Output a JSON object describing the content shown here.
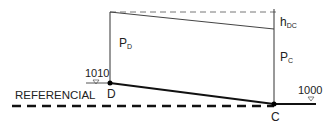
{
  "diagram": {
    "labels": {
      "referencial": "REFERENCIAL",
      "point_d": "D",
      "point_c": "C",
      "elev_d": "1010",
      "elev_c": "1000",
      "pressure_d_main": "P",
      "pressure_d_sub": "D",
      "pressure_c_main": "P",
      "pressure_c_sub": "C",
      "headloss_main": "h",
      "headloss_sub": "DC"
    },
    "points": {
      "D": {
        "x": 110,
        "y": 83
      },
      "C": {
        "x": 274,
        "y": 104
      }
    },
    "colors": {
      "line": "#111111",
      "thin": "#333333",
      "dash": "#666666"
    }
  }
}
